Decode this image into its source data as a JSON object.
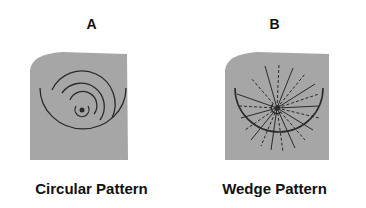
{
  "panels": [
    {
      "letter": "A",
      "caption": "Circular Pattern",
      "pattern": "circular"
    },
    {
      "letter": "B",
      "caption": "Wedge Pattern",
      "pattern": "wedge"
    }
  ],
  "colors": {
    "plate": "#a6a6a6",
    "lines": "#2a2a2a"
  }
}
